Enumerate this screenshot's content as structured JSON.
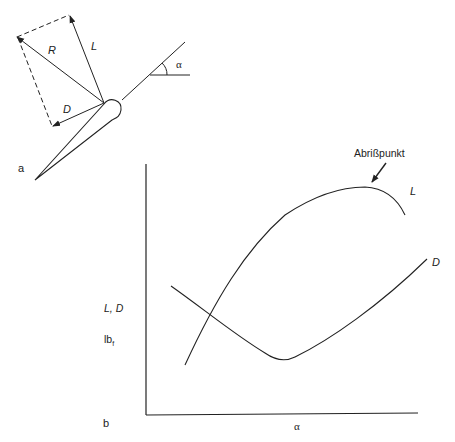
{
  "panel_a": {
    "label": "a",
    "vectors": {
      "resultant": "R",
      "lift": "L",
      "drag": "D"
    },
    "angle_symbol": "α"
  },
  "panel_b": {
    "label": "b",
    "y_axis_label": "L, D",
    "y_axis_unit": "lb",
    "y_axis_unit_sub": "f",
    "x_axis_label": "α",
    "curve_lift_label": "L",
    "curve_drag_label": "D",
    "annotation": "Abrißpunkt"
  },
  "colors": {
    "stroke": "#222222",
    "background": "#ffffff"
  }
}
